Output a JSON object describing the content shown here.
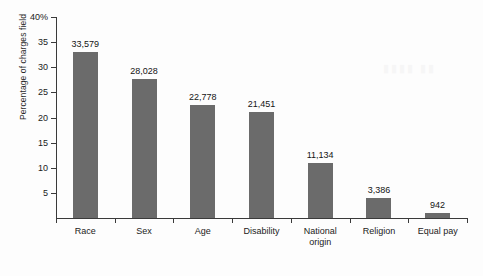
{
  "chart_data": {
    "type": "bar",
    "title": "",
    "xlabel": "",
    "ylabel": "Percentage of charges field",
    "categories": [
      "Race",
      "Sex",
      "Age",
      "Disability",
      "National origin",
      "Religion",
      "Equal pay"
    ],
    "category_lines": [
      [
        "Race"
      ],
      [
        "Sex"
      ],
      [
        "Age"
      ],
      [
        "Disability"
      ],
      [
        "National",
        "origin"
      ],
      [
        "Religion"
      ],
      [
        "Equal pay"
      ]
    ],
    "values": [
      33.0,
      27.6,
      22.4,
      21.1,
      11.0,
      3.9,
      1.0
    ],
    "point_labels": [
      "33,579",
      "28,028",
      "22,778",
      "21,451",
      "11,134",
      "3,386",
      "942"
    ],
    "counts": [
      33579,
      28028,
      22778,
      21451,
      11134,
      3386,
      942
    ],
    "ylim": [
      0,
      40
    ],
    "yticks": [
      0,
      5,
      10,
      15,
      20,
      25,
      30,
      35,
      40
    ],
    "ytick_labels": [
      "",
      "5",
      "10",
      "15",
      "20",
      "25",
      "30",
      "35",
      "40%"
    ],
    "grid": false,
    "legend": "none",
    "bar_color": "#6b6b6b",
    "axis_color": "#3a3a3a",
    "background_color": "#fdfdfd"
  }
}
